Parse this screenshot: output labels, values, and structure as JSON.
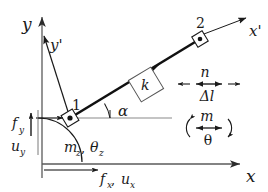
{
  "figure": {
    "background_color": "#ffffff",
    "stroke_color": "#1a1a1a",
    "axis_color": "#555555"
  },
  "global_axes": {
    "x_label": "x",
    "y_label": "y",
    "origin_label": ""
  },
  "local_axes": {
    "x_label": "x'",
    "y_label": "y'"
  },
  "nodes": [
    {
      "id": "node-1",
      "label": "1"
    },
    {
      "id": "node-2",
      "label": "2"
    }
  ],
  "element": {
    "stiffness_label": "k",
    "angle_label": "α"
  },
  "dof_labels": {
    "force_x": "f",
    "force_x_sub": "x",
    "disp_x": "u",
    "disp_x_sub": "x",
    "force_y": "f",
    "force_y_sub": "y",
    "disp_y": "u",
    "disp_y_sub": "y",
    "moment_z": "m",
    "moment_z_sub": "z",
    "rotation_z": "θ",
    "rotation_z_sub": "z",
    "comma": " ,",
    "bottom_group": "fₓ , uₓ",
    "arc_group": "m₂ , θ₂"
  },
  "legend": {
    "axial": {
      "force_symbol": "n",
      "deformation_symbol": "Δl"
    },
    "bending": {
      "moment_symbol": "m",
      "rotation_symbol": "θ"
    }
  }
}
